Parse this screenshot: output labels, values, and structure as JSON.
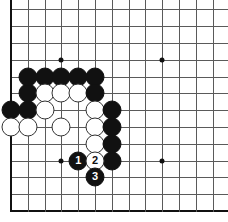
{
  "board": {
    "kind": "go-board-diagram",
    "corner": "bottom-left",
    "origin_x": 11,
    "origin_y": 211,
    "spacing": 16.8,
    "cols_visible": 13,
    "rows_visible": 13,
    "line_color": "#5a5a5a",
    "edge_color": "#111111",
    "background": "#ffffff",
    "black_color": "#111111",
    "white_color": "#ffffff",
    "hoshi": [
      {
        "col": 4,
        "row": 4
      },
      {
        "col": 10,
        "row": 4
      },
      {
        "col": 4,
        "row": 10
      },
      {
        "col": 10,
        "row": 10
      }
    ],
    "stones": [
      {
        "col": 1,
        "row": 7,
        "color": "black",
        "label": ""
      },
      {
        "col": 2,
        "row": 7,
        "color": "black",
        "label": ""
      },
      {
        "col": 1,
        "row": 6,
        "color": "white",
        "label": ""
      },
      {
        "col": 2,
        "row": 6,
        "color": "white",
        "label": ""
      },
      {
        "col": 2,
        "row": 8,
        "color": "black",
        "label": ""
      },
      {
        "col": 2,
        "row": 9,
        "color": "black",
        "label": ""
      },
      {
        "col": 3,
        "row": 9,
        "color": "black",
        "label": ""
      },
      {
        "col": 4,
        "row": 9,
        "color": "black",
        "label": ""
      },
      {
        "col": 5,
        "row": 9,
        "color": "black",
        "label": ""
      },
      {
        "col": 6,
        "row": 9,
        "color": "black",
        "label": ""
      },
      {
        "col": 3,
        "row": 8,
        "color": "white",
        "label": ""
      },
      {
        "col": 4,
        "row": 8,
        "color": "white",
        "label": ""
      },
      {
        "col": 5,
        "row": 8,
        "color": "white",
        "label": ""
      },
      {
        "col": 6,
        "row": 8,
        "color": "black",
        "label": ""
      },
      {
        "col": 3,
        "row": 7,
        "color": "white",
        "label": ""
      },
      {
        "col": 4,
        "row": 6,
        "color": "white",
        "label": ""
      },
      {
        "col": 6,
        "row": 7,
        "color": "white",
        "label": ""
      },
      {
        "col": 7,
        "row": 7,
        "color": "black",
        "label": ""
      },
      {
        "col": 6,
        "row": 6,
        "color": "white",
        "label": ""
      },
      {
        "col": 7,
        "row": 6,
        "color": "black",
        "label": ""
      },
      {
        "col": 6,
        "row": 5,
        "color": "white",
        "label": ""
      },
      {
        "col": 7,
        "row": 5,
        "color": "black",
        "label": ""
      },
      {
        "col": 7,
        "row": 4,
        "color": "black",
        "label": ""
      },
      {
        "col": 5,
        "row": 4,
        "color": "black",
        "label": "1"
      },
      {
        "col": 6,
        "row": 4,
        "color": "white",
        "label": "2"
      },
      {
        "col": 6,
        "row": 3,
        "color": "black",
        "label": "3"
      }
    ],
    "move_sequence": [
      {
        "number": "1",
        "color": "black"
      },
      {
        "number": "2",
        "color": "white"
      },
      {
        "number": "3",
        "color": "black"
      }
    ]
  }
}
